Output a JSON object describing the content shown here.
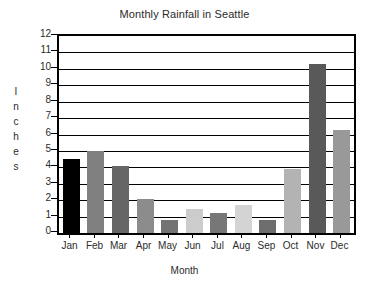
{
  "chart_data": {
    "type": "bar",
    "title": "Monthly Rainfall in Seattle",
    "xlabel": "Month",
    "ylabel": "Inches",
    "categories": [
      "Jan",
      "Feb",
      "Mar",
      "Apr",
      "May",
      "Jun",
      "Jul",
      "Aug",
      "Sep",
      "Oct",
      "Nov",
      "Dec"
    ],
    "values": [
      4.5,
      5.0,
      4.1,
      2.1,
      0.8,
      1.45,
      1.2,
      1.7,
      0.8,
      3.9,
      10.3,
      6.3
    ],
    "bar_colors": [
      "#000000",
      "#808080",
      "#666666",
      "#8c8c8c",
      "#737373",
      "#cccccc",
      "#777777",
      "#d4d4d4",
      "#6e6e6e",
      "#b3b3b3",
      "#595959",
      "#999999"
    ],
    "ylim": [
      0,
      12
    ],
    "ytick_labels": [
      "12",
      "11",
      "10",
      "9",
      "8",
      "7",
      "6",
      "5",
      "4",
      "3",
      "2",
      "1",
      "0"
    ],
    "ytick_values": [
      12,
      11,
      10,
      9,
      8,
      7,
      6,
      5,
      4,
      3,
      2,
      1,
      0
    ],
    "grid": true,
    "legend": false,
    "axis_color": "#000000",
    "background": "#ffffff"
  }
}
